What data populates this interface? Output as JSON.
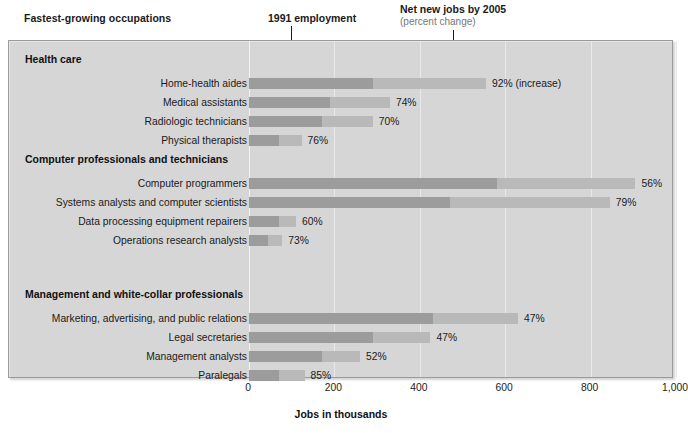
{
  "header": {
    "title": "Fastest-growing occupations",
    "annotation_employment": "1991 employment",
    "annotation_net_jobs": "Net new jobs by 2005",
    "annotation_net_jobs_sub": "(percent change)"
  },
  "axis": {
    "title": "Jobs in thousands",
    "ticks": [
      "0",
      "200",
      "400",
      "600",
      "800",
      "1,000"
    ]
  },
  "colors": {
    "panel_background": "#d6d6d6",
    "bar_base": "#9c9c9c",
    "bar_growth": "#b9b9b9",
    "panel_border": "#9b9b9b",
    "gridline": "#e9e9e9",
    "subtitle_text": "#777777"
  },
  "groups": [
    {
      "header": "Health care",
      "rows": [
        {
          "label": "Home-health aides",
          "value_label": "92% (increase)"
        },
        {
          "label": "Medical assistants",
          "value_label": "74%"
        },
        {
          "label": "Radiologic technicians",
          "value_label": "70%"
        },
        {
          "label": "Physical therapists",
          "value_label": "76%"
        }
      ]
    },
    {
      "header": "Computer professionals and technicians",
      "rows": [
        {
          "label": "Computer programmers",
          "value_label": "56%"
        },
        {
          "label": "Systems analysts and computer scientists",
          "value_label": "79%"
        },
        {
          "label": "Data processing equipment repairers",
          "value_label": "60%"
        },
        {
          "label": "Operations research analysts",
          "value_label": "73%"
        }
      ]
    },
    {
      "header": "Management and white-collar professionals",
      "rows": [
        {
          "label": "Marketing, advertising, and public relations",
          "value_label": "47%"
        },
        {
          "label": "Legal secretaries",
          "value_label": "47%"
        },
        {
          "label": "Management analysts",
          "value_label": "52%"
        },
        {
          "label": "Paralegals",
          "value_label": "85%"
        }
      ]
    }
  ],
  "chart_data": {
    "type": "bar",
    "title": "Fastest-growing occupations",
    "subtitle": "",
    "orientation": "horizontal",
    "stacked": true,
    "xlabel": "Jobs in thousands",
    "ylabel": "",
    "xlim": [
      0,
      1000
    ],
    "xticks": [
      0,
      200,
      400,
      600,
      800,
      1000
    ],
    "grid": true,
    "legend_position": "top-annotations",
    "series": [
      {
        "name": "1991 employment",
        "values": [
          290,
          190,
          170,
          70,
          580,
          470,
          70,
          45,
          430,
          290,
          170,
          70
        ]
      },
      {
        "name": "Net new jobs by 2005",
        "values": [
          265,
          140,
          120,
          53,
          325,
          375,
          40,
          33,
          200,
          135,
          90,
          60
        ]
      }
    ],
    "categories": [
      "Home-health aides",
      "Medical assistants",
      "Radiologic technicians",
      "Physical therapists",
      "Computer programmers",
      "Systems analysts and computer scientists",
      "Data processing equipment repairers",
      "Operations research analysts",
      "Marketing, advertising, and public relations",
      "Legal secretaries",
      "Management analysts",
      "Paralegals"
    ],
    "category_groups": [
      {
        "header": "Health care",
        "category_indices": [
          0,
          1,
          2,
          3
        ]
      },
      {
        "header": "Computer professionals and technicians",
        "category_indices": [
          4,
          5,
          6,
          7
        ]
      },
      {
        "header": "Management and white-collar professionals",
        "category_indices": [
          8,
          9,
          10,
          11
        ]
      }
    ],
    "data_labels": [
      "92% (increase)",
      "74%",
      "70%",
      "76%",
      "56%",
      "79%",
      "60%",
      "73%",
      "47%",
      "47%",
      "52%",
      "85%"
    ],
    "annotations": [
      {
        "text": "1991 employment",
        "points_to_x": 290,
        "points_to_category": "Home-health aides"
      },
      {
        "text": "Net new jobs by 2005 (percent change)",
        "points_to_x": 505,
        "points_to_category": "Home-health aides"
      }
    ]
  }
}
